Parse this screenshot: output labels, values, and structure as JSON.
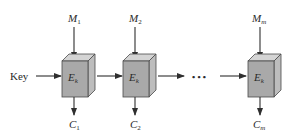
{
  "diagram": {
    "type": "ECB mode encryption",
    "key_label": "Key",
    "ellipsis": "• • •",
    "blocks": [
      {
        "input": "M",
        "input_sub": "1",
        "cipher": "E",
        "cipher_sub": "k",
        "output": "C",
        "output_sub": "1"
      },
      {
        "input": "M",
        "input_sub": "2",
        "cipher": "E",
        "cipher_sub": "k",
        "output": "C",
        "output_sub": "2"
      },
      {
        "input": "M",
        "input_sub": "m",
        "cipher": "E",
        "cipher_sub": "k",
        "output": "C",
        "output_sub": "m"
      }
    ],
    "colors": {
      "front_face": "#a9a9a9",
      "top_face": "#d4d4d4",
      "side_face": "#bdbdbd",
      "edge": "#4a4a4a",
      "arrow": "#2f2f2f",
      "text": "#2a2a2a"
    }
  }
}
